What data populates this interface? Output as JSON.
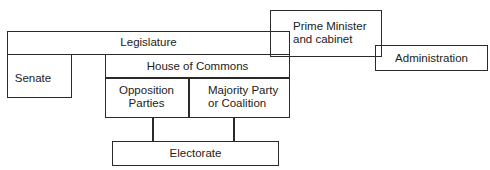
{
  "diagram": {
    "type": "organizational-structure",
    "nodes": {
      "legislature": {
        "label": "Legislature"
      },
      "senate": {
        "label": "Senate"
      },
      "house_of_commons": {
        "label": "House of Commons"
      },
      "opposition": {
        "line1": "Opposition",
        "line2": "Parties"
      },
      "majority": {
        "line1": "Majority Party",
        "line2": "or Coalition"
      },
      "electorate": {
        "label": "Electorate"
      },
      "prime_minister": {
        "line1": "Prime Minister",
        "line2": "and cabinet"
      },
      "administration": {
        "label": "Administration"
      }
    },
    "edges": [
      {
        "from": "opposition",
        "to": "electorate"
      },
      {
        "from": "majority",
        "to": "electorate"
      }
    ],
    "colors": {
      "line": "#2a2a2a",
      "text": "#222222",
      "background": "#ffffff"
    }
  }
}
